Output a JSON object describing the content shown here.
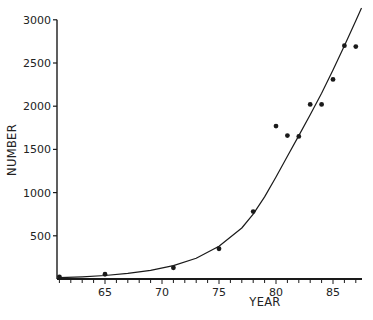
{
  "chart_data": {
    "type": "scatter",
    "title": "",
    "xlabel": "YEAR",
    "ylabel": "NUMBER",
    "xlim": [
      60.8,
      87.5
    ],
    "ylim": [
      0,
      3000
    ],
    "x_ticks": [
      65,
      70,
      75,
      80,
      85
    ],
    "x_minor_ticks_every": 1,
    "y_ticks": [
      500,
      1000,
      1500,
      2000,
      2500,
      3000
    ],
    "grid": false,
    "legend": null,
    "series": [
      {
        "name": "observed",
        "kind": "scatter",
        "x": [
          61,
          65,
          71,
          75,
          78,
          80,
          81,
          82,
          83,
          84,
          85,
          86,
          87
        ],
        "y": [
          25,
          55,
          130,
          350,
          780,
          1770,
          1660,
          1650,
          2020,
          2020,
          2310,
          2700,
          2690
        ]
      },
      {
        "name": "fitted curve",
        "kind": "line",
        "x": [
          61,
          63,
          65,
          67,
          69,
          71,
          73,
          75,
          77,
          78,
          79,
          80,
          81,
          82,
          83,
          84,
          85,
          86,
          87,
          87.5
        ],
        "y": [
          15,
          25,
          40,
          65,
          100,
          155,
          240,
          380,
          590,
          750,
          950,
          1180,
          1420,
          1660,
          1900,
          2150,
          2420,
          2700,
          2990,
          3150
        ]
      }
    ]
  },
  "colors": {
    "ink": "#1a1a1a",
    "background": "#ffffff"
  }
}
